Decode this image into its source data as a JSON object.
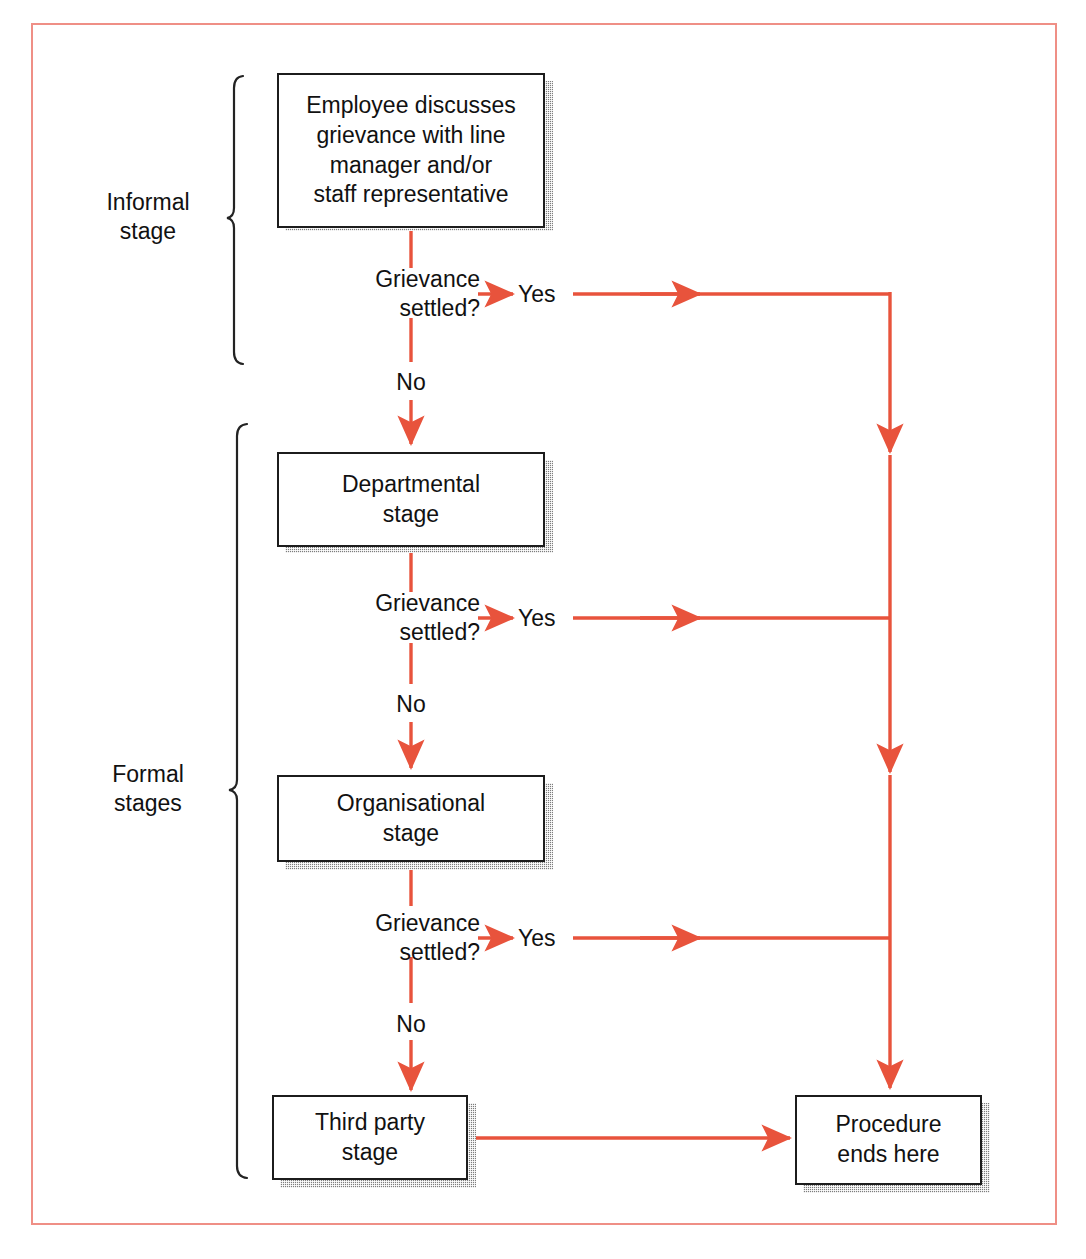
{
  "figure": {
    "type": "flowchart",
    "frame_color": "#ef8f86",
    "arrow_color": "#e8533c",
    "box_border_color": "#1c1c1c",
    "background": "#ffffff"
  },
  "groups": [
    {
      "id": "informal",
      "label": "Informal\nstage"
    },
    {
      "id": "formal",
      "label": "Formal\nstages"
    }
  ],
  "nodes": [
    {
      "id": "start",
      "label": "Employee discusses\ngrievance with line\nmanager and/or\nstaff representative"
    },
    {
      "id": "departmental",
      "label": "Departmental\nstage"
    },
    {
      "id": "organisational",
      "label": "Organisational\nstage"
    },
    {
      "id": "third-party",
      "label": "Third party\nstage"
    },
    {
      "id": "end",
      "label": "Procedure\nends here"
    }
  ],
  "decisions": [
    {
      "id": "decision-1",
      "label": "Grievance\nsettled?",
      "yes": "Yes",
      "no": "No"
    },
    {
      "id": "decision-2",
      "label": "Grievance\nsettled?",
      "yes": "Yes",
      "no": "No"
    },
    {
      "id": "decision-3",
      "label": "Grievance\nsettled?",
      "yes": "Yes",
      "no": "No"
    }
  ]
}
